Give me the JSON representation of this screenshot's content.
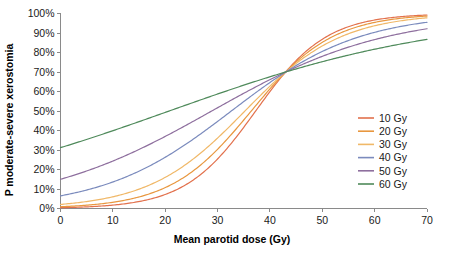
{
  "chart_data": {
    "type": "line",
    "title": "",
    "xlabel": "Mean parotid dose (Gy)",
    "ylabel": "P moderate-severe xerostomia",
    "xlim": [
      0,
      70
    ],
    "ylim": [
      0,
      1
    ],
    "grid": false,
    "legend_position": "right",
    "x_ticks": [
      0,
      10,
      20,
      30,
      40,
      50,
      60,
      70
    ],
    "x_tick_labels": [
      "0",
      "10",
      "20",
      "30",
      "40",
      "50",
      "60",
      "70"
    ],
    "y_ticks": [
      0,
      0.1,
      0.2,
      0.3,
      0.4,
      0.5,
      0.6,
      0.7,
      0.8,
      0.9,
      1.0
    ],
    "y_tick_labels": [
      "0%",
      "10%",
      "20%",
      "30%",
      "40%",
      "50%",
      "60%",
      "70%",
      "80%",
      "90%",
      "100%"
    ],
    "convergence_point": {
      "x": 43,
      "y": 0.7
    },
    "x": [
      0,
      5,
      10,
      15,
      20,
      25,
      30,
      35,
      40,
      43,
      45,
      50,
      55,
      60,
      65,
      70
    ],
    "series": [
      {
        "name": "10 Gy",
        "color": "#e2714d",
        "values": [
          0.004,
          0.007,
          0.013,
          0.024,
          0.044,
          0.08,
          0.145,
          0.262,
          0.499,
          0.7,
          0.795,
          0.915,
          0.958,
          0.976,
          0.985,
          0.99
        ]
      },
      {
        "name": "20 Gy",
        "color": "#e8973f",
        "values": [
          0.009,
          0.015,
          0.025,
          0.042,
          0.069,
          0.113,
          0.183,
          0.29,
          0.47,
          0.7,
          0.754,
          0.872,
          0.932,
          0.96,
          0.975,
          0.982
        ]
      },
      {
        "name": "30 Gy",
        "color": "#f0b868",
        "values": [
          0.021,
          0.031,
          0.047,
          0.07,
          0.104,
          0.152,
          0.219,
          0.312,
          0.445,
          0.7,
          0.703,
          0.816,
          0.893,
          0.936,
          0.96,
          0.974
        ]
      },
      {
        "name": "40 Gy",
        "color": "#7b8bbd",
        "values": [
          0.065,
          0.086,
          0.112,
          0.145,
          0.186,
          0.237,
          0.299,
          0.373,
          0.459,
          0.7,
          0.637,
          0.728,
          0.806,
          0.866,
          0.909,
          0.939
        ]
      },
      {
        "name": "50 Gy",
        "color": "#8e6f9e",
        "values": [
          0.15,
          0.18,
          0.214,
          0.253,
          0.296,
          0.344,
          0.396,
          0.451,
          0.508,
          0.7,
          0.603,
          0.679,
          0.748,
          0.807,
          0.856,
          0.894
        ]
      },
      {
        "name": "60 Gy",
        "color": "#4f8a5b",
        "values": [
          0.312,
          0.343,
          0.374,
          0.406,
          0.439,
          0.472,
          0.505,
          0.538,
          0.57,
          0.7,
          0.618,
          0.665,
          0.709,
          0.75,
          0.788,
          0.822
        ]
      }
    ]
  },
  "legend": {
    "items": [
      {
        "label": "10 Gy",
        "color": "#e2714d"
      },
      {
        "label": "20 Gy",
        "color": "#e8973f"
      },
      {
        "label": "30 Gy",
        "color": "#f0b868"
      },
      {
        "label": "40 Gy",
        "color": "#7b8bbd"
      },
      {
        "label": "50 Gy",
        "color": "#8e6f9e"
      },
      {
        "label": "60 Gy",
        "color": "#4f8a5b"
      }
    ]
  }
}
